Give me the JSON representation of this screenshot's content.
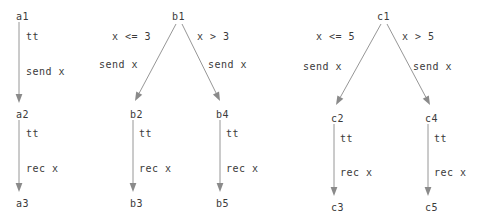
{
  "diagram": {
    "type": "three-transition-system-graphs",
    "background_color": "#ffffff",
    "text_color": "#3a3a3a",
    "edge_color": "#8a8a8a",
    "graphs": [
      {
        "id": "graph-a",
        "root": "a1",
        "nodes": [
          {
            "id": "a1",
            "label": "a1",
            "x": 16,
            "y": 12
          },
          {
            "id": "a2",
            "label": "a2",
            "x": 16,
            "y": 110
          },
          {
            "id": "a3",
            "label": "a3",
            "x": 16,
            "y": 199
          }
        ],
        "edges": [
          {
            "id": "a1-a2",
            "from": "a1",
            "to": "a2",
            "guard": "tt",
            "guard_x": 26,
            "guard_y": 32,
            "action": "send x",
            "action_x": 26,
            "action_y": 67,
            "x1": 19,
            "y1": 22,
            "x2": 19,
            "y2": 103
          },
          {
            "id": "a2-a3",
            "from": "a2",
            "to": "a3",
            "guard": "tt",
            "guard_x": 26,
            "guard_y": 129,
            "action": "rec x",
            "action_x": 26,
            "action_y": 164,
            "x1": 19,
            "y1": 120,
            "x2": 19,
            "y2": 192
          }
        ]
      },
      {
        "id": "graph-b",
        "root": "b1",
        "nodes": [
          {
            "id": "b1",
            "label": "b1",
            "x": 172,
            "y": 12
          },
          {
            "id": "b2",
            "label": "b2",
            "x": 130,
            "y": 110
          },
          {
            "id": "b4",
            "label": "b4",
            "x": 216,
            "y": 110
          },
          {
            "id": "b3",
            "label": "b3",
            "x": 130,
            "y": 199
          },
          {
            "id": "b5",
            "label": "b5",
            "x": 216,
            "y": 199
          }
        ],
        "edges": [
          {
            "id": "b1-b2",
            "from": "b1",
            "to": "b2",
            "guard": "x <= 3",
            "guard_x": 112,
            "guard_y": 32,
            "action": "send x",
            "action_x": 99,
            "action_y": 60,
            "x1": 176,
            "y1": 24,
            "x2": 135,
            "y2": 101
          },
          {
            "id": "b1-b4",
            "from": "b1",
            "to": "b4",
            "guard": "x > 3",
            "guard_x": 197,
            "guard_y": 32,
            "action": "send x",
            "action_x": 208,
            "action_y": 60,
            "x1": 182,
            "y1": 24,
            "x2": 220,
            "y2": 101
          },
          {
            "id": "b2-b3",
            "from": "b2",
            "to": "b3",
            "guard": "tt",
            "guard_x": 139,
            "guard_y": 129,
            "action": "rec x",
            "action_x": 139,
            "action_y": 164,
            "x1": 133,
            "y1": 120,
            "x2": 133,
            "y2": 192
          },
          {
            "id": "b4-b5",
            "from": "b4",
            "to": "b5",
            "guard": "tt",
            "guard_x": 226,
            "guard_y": 129,
            "action": "rec x",
            "action_x": 226,
            "action_y": 164,
            "x1": 220,
            "y1": 120,
            "x2": 220,
            "y2": 192
          }
        ]
      },
      {
        "id": "graph-c",
        "root": "c1",
        "nodes": [
          {
            "id": "c1",
            "label": "c1",
            "x": 377,
            "y": 12
          },
          {
            "id": "c2",
            "label": "c2",
            "x": 331,
            "y": 114
          },
          {
            "id": "c4",
            "label": "c4",
            "x": 425,
            "y": 114
          },
          {
            "id": "c3",
            "label": "c3",
            "x": 331,
            "y": 203
          },
          {
            "id": "c5",
            "label": "c5",
            "x": 425,
            "y": 203
          }
        ],
        "edges": [
          {
            "id": "c1-c2",
            "from": "c1",
            "to": "c2",
            "guard": "x <= 5",
            "guard_x": 316,
            "guard_y": 32,
            "action": "send x",
            "action_x": 303,
            "action_y": 62,
            "x1": 381,
            "y1": 24,
            "x2": 336,
            "y2": 105
          },
          {
            "id": "c1-c4",
            "from": "c1",
            "to": "c4",
            "guard": "x > 5",
            "guard_x": 402,
            "guard_y": 32,
            "action": "send x",
            "action_x": 413,
            "action_y": 62,
            "x1": 387,
            "y1": 24,
            "x2": 430,
            "y2": 105
          },
          {
            "id": "c2-c3",
            "from": "c2",
            "to": "c3",
            "guard": "tt",
            "guard_x": 340,
            "guard_y": 134,
            "action": "rec x",
            "action_x": 340,
            "action_y": 168,
            "x1": 334,
            "y1": 124,
            "x2": 334,
            "y2": 196
          },
          {
            "id": "c4-c5",
            "from": "c4",
            "to": "c5",
            "guard": "tt",
            "guard_x": 434,
            "guard_y": 134,
            "action": "rec x",
            "action_x": 434,
            "action_y": 168,
            "x1": 428,
            "y1": 124,
            "x2": 428,
            "y2": 196
          }
        ]
      }
    ]
  }
}
